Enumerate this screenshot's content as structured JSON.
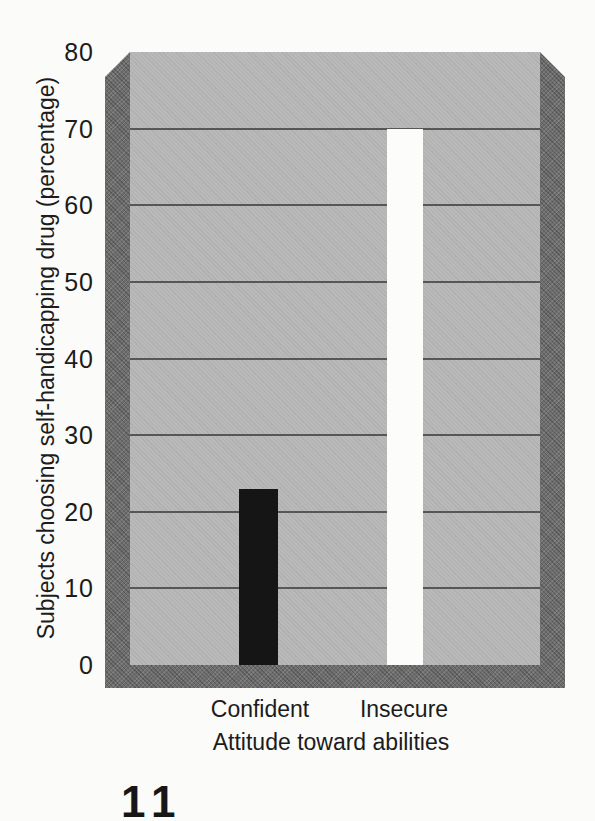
{
  "figure_number": "11",
  "chart_data": {
    "type": "bar",
    "title": "",
    "categories": [
      "Confident",
      "Insecure"
    ],
    "values": [
      23,
      70
    ],
    "xlabel": "Attitude toward abilities",
    "ylabel": "Subjects choosing self-handicapping drug (percentage)",
    "ylim": [
      0,
      80
    ],
    "yticks": [
      0,
      10,
      20,
      30,
      40,
      50,
      60,
      70,
      80
    ],
    "grid": "horizontal gridlines every 10 units",
    "legend": "none",
    "bar_colors": [
      "#151515",
      "#fcfcfa"
    ],
    "plot_bg": "#b9b9b9",
    "frame_color": "#6e6e6e",
    "gridline_color": "#4c4c4c"
  }
}
